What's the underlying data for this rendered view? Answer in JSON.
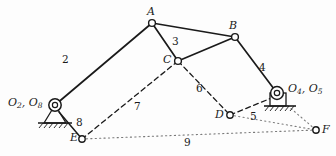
{
  "figure": {
    "type": "kinematic-linkage-diagram",
    "background_color": "#fdfdfd",
    "line_color": "#1a1a1a"
  },
  "joints": [
    {
      "id": "A",
      "label": "A",
      "x": 152,
      "y": 23,
      "label_x": 147,
      "label_y": 6,
      "style": "open-circle"
    },
    {
      "id": "B",
      "label": "B",
      "x": 235,
      "y": 37,
      "label_x": 229,
      "label_y": 20,
      "style": "open-circle"
    },
    {
      "id": "C",
      "label": "C",
      "x": 178,
      "y": 61,
      "label_x": 163,
      "label_y": 54,
      "style": "open-circle"
    },
    {
      "id": "D",
      "label": "D",
      "x": 230,
      "y": 115,
      "label_x": 215,
      "label_y": 109,
      "style": "open-circle"
    },
    {
      "id": "E",
      "label": "E",
      "x": 82,
      "y": 139,
      "label_x": 70,
      "label_y": 132,
      "style": "open-circle"
    },
    {
      "id": "F",
      "label": "F",
      "x": 316,
      "y": 130,
      "label_x": 322,
      "label_y": 124,
      "style": "open-circle"
    },
    {
      "id": "O2",
      "label": "O2, O8",
      "x": 55,
      "y": 105,
      "label_x": 8,
      "label_y": 97,
      "style": "ground-pivot-triangle"
    },
    {
      "id": "O4",
      "label": "O4, O5",
      "x": 277,
      "y": 93,
      "label_x": 288,
      "label_y": 83,
      "style": "ground-pivot-square"
    }
  ],
  "ground_labels": {
    "left": {
      "base": "O",
      "sub1": "2",
      "sep": ", ",
      "base2": "O",
      "sub2": "8"
    },
    "right": {
      "base": "O",
      "sub1": "4",
      "sep": ", ",
      "base2": "O",
      "sub2": "5"
    }
  },
  "links": [
    {
      "number": "2",
      "from": "O2",
      "to": "A",
      "style": "solid",
      "label_x": 62,
      "label_y": 54
    },
    {
      "number": "3",
      "from": "A",
      "to": "B",
      "style": "solid",
      "label_x": 172,
      "label_y": 36
    },
    {
      "number": "4",
      "from": "B",
      "to": "O4",
      "style": "solid",
      "label_x": 259,
      "label_y": 62
    },
    {
      "number": "5",
      "from": "D",
      "to": "O4",
      "style": "dashed",
      "label_x": 250,
      "label_y": 111
    },
    {
      "number": "6",
      "from": "C",
      "to": "D",
      "style": "dashed",
      "label_x": 196,
      "label_y": 83
    },
    {
      "number": "7",
      "from": "C",
      "to": "E",
      "style": "dashed",
      "label_x": 134,
      "label_y": 101
    },
    {
      "number": "8",
      "from": "O2",
      "to": "E",
      "style": "solid",
      "label_x": 76,
      "label_y": 117
    },
    {
      "number": "9",
      "from": "E",
      "to": "F",
      "style": "dotted",
      "label_x": 184,
      "label_y": 137
    }
  ],
  "extra_segments": [
    {
      "name": "triangle-A-C",
      "from": "A",
      "to": "C",
      "style": "solid"
    },
    {
      "name": "triangle-B-C",
      "from": "B",
      "to": "C",
      "style": "solid"
    },
    {
      "name": "dotted-D-F",
      "from": "D",
      "to": "F",
      "style": "dotted"
    },
    {
      "name": "dotted-O4-F",
      "from": "O4",
      "to": "F",
      "style": "dotted"
    }
  ]
}
